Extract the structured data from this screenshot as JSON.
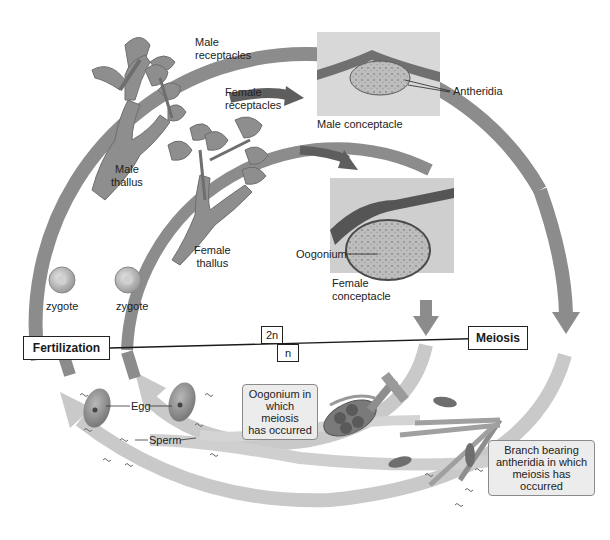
{
  "diagram": {
    "type": "life-cycle",
    "colors": {
      "diploid_arrow": "#8c8c8c",
      "haploid_arrow": "#c9c9c9",
      "background": "#ffffff",
      "label_box_bg": "#ececec"
    },
    "labels": {
      "male_receptacles": [
        "Male",
        "receptacles"
      ],
      "female_receptacles": [
        "Female",
        "receptacles"
      ],
      "male_thallus": [
        "Male",
        "thallus"
      ],
      "female_thallus": [
        "Female",
        "thallus"
      ],
      "antheridia": "Antheridia",
      "male_conceptacle": "Male conceptacle",
      "oogonium": "Oogonium",
      "female_conceptacle": [
        "Female",
        "conceptacle"
      ],
      "zygote_left": "zygote",
      "zygote_right": "zygote",
      "egg": "Egg",
      "sperm": "Sperm"
    },
    "phase_boxes": {
      "fertilization": "Fertilization",
      "meiosis": "Meiosis",
      "diploid": "2n",
      "haploid": "n"
    },
    "callouts": {
      "oogonium_meiosis": [
        "Oogonium in",
        "which meiosis",
        "has occurred"
      ],
      "branch_antheridia": [
        "Branch bearing",
        "antheridia in which",
        "meiosis has occurred"
      ]
    }
  }
}
